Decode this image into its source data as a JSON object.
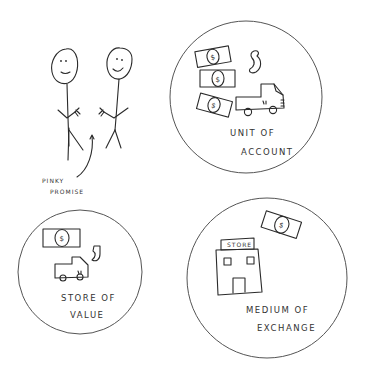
{
  "diagram": {
    "topic": "Functions of money",
    "left_scene": {
      "figures": [
        "stick-figure-left",
        "stick-figure-right"
      ],
      "caption_line1": "PINKY",
      "caption_line2": "PROMISE"
    },
    "circles": [
      {
        "id": "unit-of-account",
        "label_line1": "UNIT OF",
        "label_line2": "ACCOUNT",
        "icons": [
          "dollar-bill",
          "dollar-bill",
          "dollar-bill",
          "shrimp",
          "truck"
        ]
      },
      {
        "id": "store-of-value",
        "label_line1": "STORE OF",
        "label_line2": "VALUE",
        "icons": [
          "dollar-bill",
          "shrimp",
          "truck"
        ]
      },
      {
        "id": "medium-of-exchange",
        "label_line1": "MEDIUM OF",
        "label_line2": "EXCHANGE",
        "icons": [
          "store-building",
          "dollar-bill"
        ],
        "store_sign": "STORE"
      }
    ],
    "bill_symbol": "$"
  }
}
